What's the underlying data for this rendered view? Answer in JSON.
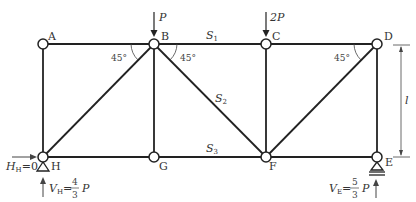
{
  "diagram": {
    "type": "truss",
    "nodes": [
      {
        "id": "A",
        "label": "A",
        "x": 43,
        "y": 44
      },
      {
        "id": "B",
        "label": "B",
        "x": 154,
        "y": 44
      },
      {
        "id": "C",
        "label": "C",
        "x": 266,
        "y": 44
      },
      {
        "id": "D",
        "label": "D",
        "x": 377,
        "y": 44
      },
      {
        "id": "H",
        "label": "H",
        "x": 43,
        "y": 157
      },
      {
        "id": "G",
        "label": "G",
        "x": 154,
        "y": 157
      },
      {
        "id": "F",
        "label": "F",
        "x": 266,
        "y": 157
      },
      {
        "id": "E",
        "label": "E",
        "x": 377,
        "y": 157
      }
    ],
    "members": [
      [
        "A",
        "B"
      ],
      [
        "B",
        "C"
      ],
      [
        "C",
        "D"
      ],
      [
        "H",
        "G"
      ],
      [
        "G",
        "F"
      ],
      [
        "F",
        "E"
      ],
      [
        "A",
        "H"
      ],
      [
        "B",
        "G"
      ],
      [
        "C",
        "F"
      ],
      [
        "D",
        "E"
      ],
      [
        "H",
        "B"
      ],
      [
        "B",
        "F"
      ],
      [
        "F",
        "D"
      ]
    ],
    "member_labels": {
      "S1": {
        "text": "S",
        "sub": "1"
      },
      "S2": {
        "text": "S",
        "sub": "2"
      },
      "S3": {
        "text": "S",
        "sub": "3"
      }
    },
    "angles": [
      "45°",
      "45°",
      "45°"
    ],
    "loads": {
      "B": "P",
      "C": "2P"
    },
    "reactions": {
      "H_horizontal": {
        "symbol": "H",
        "sub": "H",
        "value": "=0"
      },
      "H_vertical": {
        "symbol": "V",
        "sub": "H",
        "eq": "=",
        "num": "4",
        "den": "3",
        "var": "P"
      },
      "E_vertical": {
        "symbol": "V",
        "sub": "E",
        "eq": "=",
        "num": "5",
        "den": "3",
        "var": "P"
      }
    },
    "dimension": {
      "label": "l"
    }
  }
}
